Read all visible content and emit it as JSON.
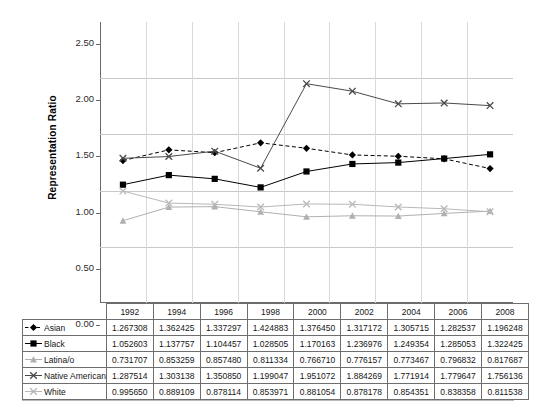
{
  "chart_data": {
    "type": "line",
    "title": "",
    "xlabel": "",
    "ylabel": "Representation Ratio",
    "ylim": [
      0.0,
      2.5
    ],
    "ytick_labels": [
      "0.00",
      "0.50",
      "1.00",
      "1.50",
      "2.00",
      "2.50"
    ],
    "ytick_values": [
      0.0,
      0.5,
      1.0,
      1.5,
      2.0,
      2.5
    ],
    "grid": "horizontal-and-vertical",
    "legend_position": "data-table-row-headers",
    "categories": [
      "1992",
      "1994",
      "1996",
      "1998",
      "2000",
      "2002",
      "2004",
      "2006",
      "2008"
    ],
    "series": [
      {
        "name": "Asian",
        "marker": "filled-diamond",
        "line_style": "dashed",
        "color": "#000000",
        "values": [
          1.267308,
          1.362425,
          1.337297,
          1.424883,
          1.37645,
          1.317172,
          1.305715,
          1.282537,
          1.196248
        ],
        "labels": [
          "1.267308",
          "1.362425",
          "1.337297",
          "1.424883",
          "1.376450",
          "1.317172",
          "1.305715",
          "1.282537",
          "1.196248"
        ]
      },
      {
        "name": "Black",
        "marker": "filled-square",
        "line_style": "solid",
        "color": "#000000",
        "values": [
          1.052603,
          1.137757,
          1.104457,
          1.028505,
          1.170163,
          1.236976,
          1.249354,
          1.285053,
          1.322425
        ],
        "labels": [
          "1.052603",
          "1.137757",
          "1.104457",
          "1.028505",
          "1.170163",
          "1.236976",
          "1.249354",
          "1.285053",
          "1.322425"
        ]
      },
      {
        "name": "Latina/o",
        "marker": "triangle",
        "line_style": "solid",
        "color": "#b0b0b0",
        "values": [
          0.731707,
          0.853259,
          0.85748,
          0.811334,
          0.76671,
          0.776157,
          0.773467,
          0.796832,
          0.817687
        ],
        "labels": [
          "0.731707",
          "0.853259",
          "0.857480",
          "0.811334",
          "0.766710",
          "0.776157",
          "0.773467",
          "0.796832",
          "0.817687"
        ]
      },
      {
        "name": "Native American",
        "marker": "cross-x",
        "line_style": "solid",
        "color": "#4a4a4a",
        "values": [
          1.287514,
          1.303138,
          1.35085,
          1.199047,
          1.951072,
          1.884269,
          1.771914,
          1.779647,
          1.756136
        ],
        "labels": [
          "1.287514",
          "1.303138",
          "1.350850",
          "1.199047",
          "1.951072",
          "1.884269",
          "1.771914",
          "1.779647",
          "1.756136"
        ]
      },
      {
        "name": "White",
        "marker": "cross-x",
        "line_style": "solid",
        "color": "#b8b8b8",
        "values": [
          0.99565,
          0.889109,
          0.878114,
          0.853971,
          0.881054,
          0.878178,
          0.854351,
          0.838358,
          0.811538
        ],
        "labels": [
          "0.995650",
          "0.889109",
          "0.878114",
          "0.853971",
          "0.881054",
          "0.878178",
          "0.854351",
          "0.838358",
          "0.811538"
        ]
      }
    ]
  },
  "axis": {
    "y_title": "Representation Ratio"
  }
}
